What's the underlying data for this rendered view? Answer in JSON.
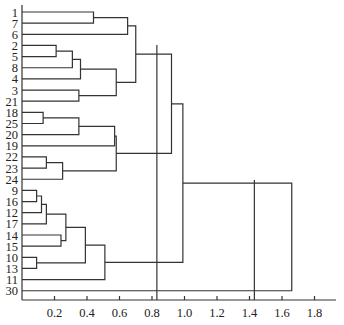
{
  "chart_data": {
    "type": "dendrogram",
    "title": "",
    "xlabel": "",
    "ylabel": "",
    "orientation": "horizontal",
    "xlim": [
      0,
      1.9
    ],
    "x_ticks": [
      0.2,
      0.4,
      0.6,
      0.8,
      1.0,
      1.2,
      1.4,
      1.6,
      1.8
    ],
    "x_tick_labels": [
      "0.2",
      "0.4",
      "0.6",
      "0.8",
      "1.0",
      "1.2",
      "1.4",
      "1.6",
      "1.8"
    ],
    "leaves": [
      "1",
      "7",
      "6",
      "2",
      "5",
      "8",
      "4",
      "3",
      "21",
      "18",
      "25",
      "20",
      "19",
      "22",
      "23",
      "24",
      "9",
      "16",
      "12",
      "17",
      "14",
      "15",
      "10",
      "13",
      "11",
      "30"
    ],
    "merges": [
      {
        "id": "A",
        "left": "1",
        "right": "7",
        "height": 0.44
      },
      {
        "id": "B",
        "left": "A",
        "right": "6",
        "height": 0.65
      },
      {
        "id": "C",
        "left": "2",
        "right": "5",
        "height": 0.21
      },
      {
        "id": "D",
        "left": "C",
        "right": "8",
        "height": 0.31
      },
      {
        "id": "E",
        "left": "D",
        "right": "4",
        "height": 0.36
      },
      {
        "id": "F",
        "left": "3",
        "right": "21",
        "height": 0.35
      },
      {
        "id": "G",
        "left": "E",
        "right": "F",
        "height": 0.58
      },
      {
        "id": "H",
        "left": "B",
        "right": "G",
        "height": 0.7
      },
      {
        "id": "I",
        "left": "18",
        "right": "25",
        "height": 0.13
      },
      {
        "id": "J",
        "left": "I",
        "right": "20",
        "height": 0.35
      },
      {
        "id": "K",
        "left": "J",
        "right": "19",
        "height": 0.57
      },
      {
        "id": "L",
        "left": "22",
        "right": "23",
        "height": 0.15
      },
      {
        "id": "M",
        "left": "L",
        "right": "24",
        "height": 0.25
      },
      {
        "id": "N",
        "left": "K",
        "right": "M",
        "height": 0.58
      },
      {
        "id": "O",
        "left": "H",
        "right": "N",
        "height": 0.92
      },
      {
        "id": "P",
        "left": "9",
        "right": "16",
        "height": 0.09
      },
      {
        "id": "Q",
        "left": "P",
        "right": "12",
        "height": 0.12
      },
      {
        "id": "R",
        "left": "Q",
        "right": "17",
        "height": 0.15
      },
      {
        "id": "S",
        "left": "14",
        "right": "15",
        "height": 0.24
      },
      {
        "id": "T",
        "left": "R",
        "right": "S",
        "height": 0.27
      },
      {
        "id": "U",
        "left": "10",
        "right": "13",
        "height": 0.09
      },
      {
        "id": "V",
        "left": "T",
        "right": "U",
        "height": 0.39
      },
      {
        "id": "W",
        "left": "V",
        "right": "11",
        "height": 0.51
      },
      {
        "id": "X",
        "left": "O",
        "right": "W",
        "height": 0.99
      },
      {
        "id": "Y",
        "left": "X",
        "right": "30",
        "height": 1.66
      }
    ],
    "cut_lines": [
      0.83,
      1.43
    ],
    "grid": false,
    "legend": null
  }
}
